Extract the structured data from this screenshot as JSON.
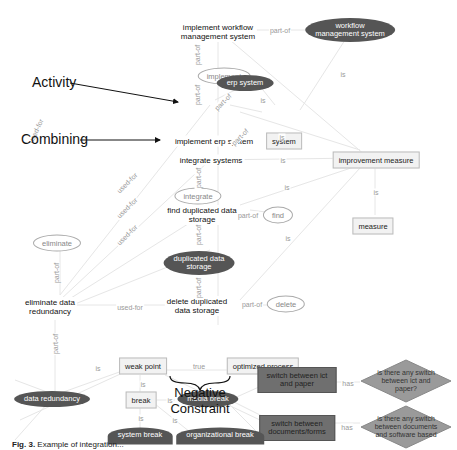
{
  "nodes": {
    "implement_workflow": "implement workflow management system",
    "implement_workflow_l1": "implement workflow",
    "implement_workflow_l2": "management system",
    "workflow_mgmt_l1": "workflow",
    "workflow_mgmt_l2": "management system",
    "implement": "implement",
    "erp_system": "erp system",
    "implement_erp": "implement erp system",
    "system": "system",
    "integrate_systems": "integrate systems",
    "improvement_measure": "improvement measure",
    "integrate": "integrate",
    "find_dup_l1": "find duplicated data",
    "find_dup_l2": "storage",
    "find": "find",
    "measure": "measure",
    "eliminate": "eliminate",
    "dup_storage_l1": "duplicated data",
    "dup_storage_l2": "storage",
    "eliminate_red_l1": "eliminate data",
    "eliminate_red_l2": "redundancy",
    "delete_dup_l1": "delete duplicated",
    "delete_dup_l2": "data storage",
    "delete": "delete",
    "weak_point": "weak point",
    "optimized_process": "optimized process",
    "data_redundancy": "data redundancy",
    "break": "break",
    "media_break": "media break",
    "switch_ict_l1": "switch between ict",
    "switch_ict_l2": "and paper",
    "switch_docs_l1": "switch between",
    "switch_docs_l2": "documents/forms",
    "q1_l1": "is there any switch",
    "q1_l2": "between ict and",
    "q1_l3": "paper?",
    "q2_l1": "is there any switch",
    "q2_l2": "between documents",
    "q2_l3": "and software based",
    "system_break": "system break",
    "organizational_break": "organizational break"
  },
  "edge_labels": {
    "part_of": "part-of",
    "is": "is",
    "used_for": "used-for",
    "true": "true",
    "has": "has"
  },
  "annotations": {
    "activity": "Activity",
    "combining": "Combining",
    "negative_l1": "Negative",
    "negative_l2": "Constraint"
  },
  "caption": {
    "prefix": "Fig. 3.",
    "text": "Example of integration..."
  },
  "colors": {
    "dark_node": "#555555",
    "box_dark": "#6f6f6f",
    "edge": "#e6e6e6",
    "label": "#999999"
  }
}
